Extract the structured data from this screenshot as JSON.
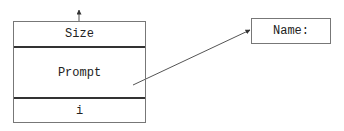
{
  "diagram": {
    "stack": {
      "cells": [
        {
          "label": "Size"
        },
        {
          "label": "Prompt"
        },
        {
          "label": "i"
        }
      ]
    },
    "target": {
      "label": "Name:"
    },
    "edges": [
      {
        "from": "stack-top",
        "to": "above",
        "style": "short-arrow-up"
      },
      {
        "from": "Prompt",
        "to": "Name:",
        "style": "arrow"
      }
    ]
  }
}
